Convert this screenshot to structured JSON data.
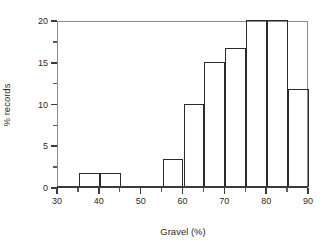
{
  "chart_data": {
    "type": "bar",
    "title": "",
    "subtitle": "",
    "xlabel": "Gravel (%)",
    "ylabel": "% records",
    "xlim": [
      30,
      90
    ],
    "ylim": [
      0,
      20
    ],
    "grid": false,
    "legend": null,
    "bin_width": 5,
    "x_ticks": [
      30,
      40,
      50,
      60,
      70,
      80,
      90
    ],
    "x_tick_labels": [
      "30",
      "40",
      "50",
      "60",
      "70",
      "80",
      "90"
    ],
    "x_minor_ticks": [
      35,
      45,
      55,
      65,
      75,
      85
    ],
    "y_ticks": [
      0,
      5,
      10,
      15,
      20
    ],
    "y_tick_labels": [
      "0",
      "5",
      "10",
      "15",
      "20"
    ],
    "y_minor_ticks": [
      2.5,
      7.5,
      12.5,
      17.5
    ],
    "categories": [
      "30-35",
      "35-40",
      "40-45",
      "45-50",
      "50-55",
      "55-60",
      "60-65",
      "65-70",
      "70-75",
      "75-80",
      "80-85",
      "85-90"
    ],
    "bins": [
      {
        "start": 30,
        "end": 35,
        "value": 0
      },
      {
        "start": 35,
        "end": 40,
        "value": 1.7
      },
      {
        "start": 40,
        "end": 45,
        "value": 1.7
      },
      {
        "start": 45,
        "end": 50,
        "value": 0
      },
      {
        "start": 50,
        "end": 55,
        "value": 0
      },
      {
        "start": 55,
        "end": 60,
        "value": 3.4
      },
      {
        "start": 60,
        "end": 65,
        "value": 10.0
      },
      {
        "start": 65,
        "end": 70,
        "value": 15.0
      },
      {
        "start": 70,
        "end": 75,
        "value": 16.7
      },
      {
        "start": 75,
        "end": 80,
        "value": 20.0
      },
      {
        "start": 80,
        "end": 85,
        "value": 20.0
      },
      {
        "start": 85,
        "end": 90,
        "value": 11.7
      }
    ],
    "values": [
      0,
      1.7,
      1.7,
      0,
      0,
      3.4,
      10.0,
      15.0,
      16.7,
      20.0,
      20.0,
      11.7
    ],
    "colors": {
      "bar_edge": "#2b2b2b",
      "bar_fill": "#ffffff",
      "frame": "#8a8a8a",
      "axis": "#3a3a3a",
      "text": "#2b2b2b",
      "background": "#ffffff"
    }
  }
}
